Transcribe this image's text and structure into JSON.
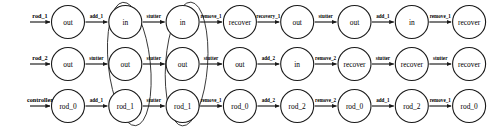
{
  "diagram": {
    "type": "state-transition-trace",
    "title": "",
    "row_count": 3,
    "nodes_per_row": 8,
    "colors": {
      "stroke": "#1a1a1a",
      "background": "#ffffff",
      "group_stroke": "#2a2a2a"
    },
    "rows": [
      {
        "id": "row-rod-1",
        "start_label": "rod_1",
        "nodes": [
          {
            "label": "out"
          },
          {
            "label": "in"
          },
          {
            "label": "in"
          },
          {
            "label": "recover"
          },
          {
            "label": "out"
          },
          {
            "label": "out"
          },
          {
            "label": "in"
          },
          {
            "label": "recover"
          }
        ],
        "edges": [
          {
            "label": "add_1"
          },
          {
            "label": "stutter"
          },
          {
            "label": "remove_1"
          },
          {
            "label": "recovery_1"
          },
          {
            "label": "stutter"
          },
          {
            "label": "add_1"
          },
          {
            "label": "remove_1"
          }
        ]
      },
      {
        "id": "row-rod-2",
        "start_label": "rod_2",
        "nodes": [
          {
            "label": "out"
          },
          {
            "label": "out"
          },
          {
            "label": "out"
          },
          {
            "label": "out"
          },
          {
            "label": "in"
          },
          {
            "label": "recover"
          },
          {
            "label": "recover"
          },
          {
            "label": "recover"
          }
        ],
        "edges": [
          {
            "label": "stutter"
          },
          {
            "label": "stutter"
          },
          {
            "label": "stutter"
          },
          {
            "label": "add_2"
          },
          {
            "label": "remove_2"
          },
          {
            "label": "stutter"
          },
          {
            "label": "stutter"
          }
        ]
      },
      {
        "id": "row-controller",
        "start_label": "controller",
        "nodes": [
          {
            "label": "rod_0"
          },
          {
            "label": "rod_1"
          },
          {
            "label": "rod_1"
          },
          {
            "label": "rod_0"
          },
          {
            "label": "rod_2"
          },
          {
            "label": "rod_0"
          },
          {
            "label": "rod_2"
          },
          {
            "label": "rod_0"
          }
        ],
        "edges": [
          {
            "label": "add_1"
          },
          {
            "label": "stutter"
          },
          {
            "label": "remove_1"
          },
          {
            "label": "add_2"
          },
          {
            "label": "remove_2"
          },
          {
            "label": "add_1"
          },
          {
            "label": "remove_1"
          }
        ]
      }
    ],
    "groups": [
      {
        "id": "group-column-2",
        "column_index": 1
      },
      {
        "id": "group-column-3",
        "column_index": 2
      }
    ]
  }
}
